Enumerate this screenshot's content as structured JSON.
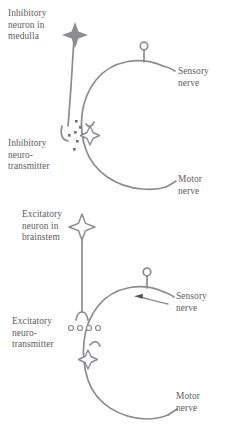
{
  "figure": {
    "stroke_color": "#8c8c90",
    "text_color": "#5d5d60",
    "background_color": "#ffffff"
  },
  "panels": [
    {
      "id": "inhibitory",
      "labels": {
        "neuron": "Inhibitory\nneuron in\nmedulla",
        "neurotransmitter": "Inhibitory\nneuro-\ntransmitter",
        "sensory_nerve": "Sensory\nnerve",
        "motor_nerve": "Motor\nnerve"
      },
      "markers": {
        "soma_star": "filled-four-point-star",
        "terminal": "synaptic-terminal-hook",
        "transmitter_particles": "filled-dots",
        "transmitter_particle_count": 6,
        "receptor_star": "outlined-four-point-star",
        "arc_knob": "open-circle",
        "arrow": null
      }
    },
    {
      "id": "excitatory",
      "labels": {
        "neuron": "Excitatory\nneuron in\nbrainstem",
        "neurotransmitter": "Excitatory\nneuro-\ntransmitter",
        "sensory_nerve": "Sensory\nnerve",
        "motor_nerve": "Motor\nnerve"
      },
      "markers": {
        "soma_star": "outlined-four-point-star",
        "terminal": "synaptic-terminal-hook",
        "transmitter_particles": "open-circles",
        "transmitter_particle_count": 4,
        "receptor_star": "outlined-four-point-star",
        "arc_knob": "open-circle",
        "arrow": "leftward-arrow-on-sensory-nerve"
      }
    }
  ]
}
